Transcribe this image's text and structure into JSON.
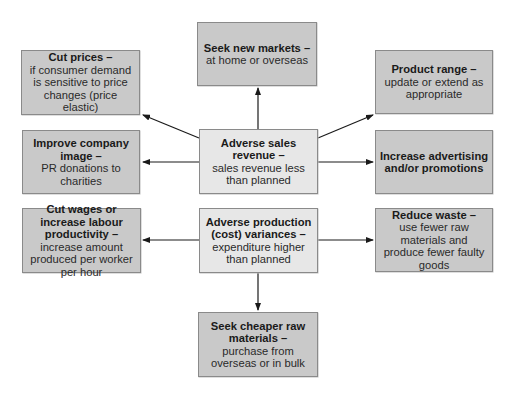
{
  "diagram": {
    "colors": {
      "outer_box": "#c9c9c9",
      "center_box": "#e7e7e7",
      "border": "#8a8a8a",
      "arrow": "#1a1a1a"
    },
    "center": {
      "sales": {
        "title": "Adverse sales revenue –",
        "desc": "sales revenue less than planned"
      },
      "production": {
        "title": "Adverse production (cost) variances –",
        "desc": "expenditure higher than planned"
      }
    },
    "actions": {
      "seek_new_markets": {
        "title": "Seek new markets –",
        "desc": "at home or overseas"
      },
      "cut_prices": {
        "title": "Cut prices –",
        "desc": "if consumer demand is sensitive to price changes (price elastic)"
      },
      "product_range": {
        "title": "Product range –",
        "desc": "update or extend as appropriate"
      },
      "improve_image": {
        "title": "Improve company image –",
        "desc": "PR donations to charities"
      },
      "increase_advertising": {
        "title": "Increase advertising and/or promotions",
        "desc": ""
      },
      "cut_wages": {
        "title": "Cut wages or increase labour productivity –",
        "desc": "increase amount produced per worker per hour"
      },
      "reduce_waste": {
        "title": "Reduce waste –",
        "desc": "use fewer raw materials and produce fewer faulty goods"
      },
      "seek_cheaper": {
        "title": "Seek cheaper raw materials –",
        "desc": "purchase from overseas or in bulk"
      }
    }
  }
}
